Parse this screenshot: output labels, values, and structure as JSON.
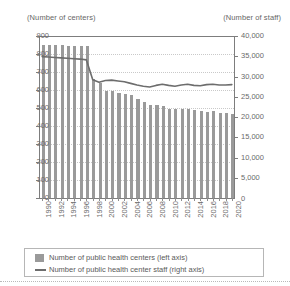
{
  "chart_data": {
    "type": "bar",
    "title": "",
    "xlabel": "",
    "left_axis_caption": "(Number of centers)",
    "right_axis_caption": "(Number of staff)",
    "grid": true,
    "legend_position": "bottom",
    "ylim": [
      0,
      900
    ],
    "y2lim": [
      0,
      40000
    ],
    "left_ticks": [
      "900",
      "800",
      "700",
      "600",
      "500",
      "400",
      "300",
      "200",
      "100",
      "0"
    ],
    "left_tick_values": [
      900,
      800,
      700,
      600,
      500,
      400,
      300,
      200,
      100,
      0
    ],
    "right_ticks": [
      "40,000",
      "35,000",
      "30,000",
      "25,000",
      "20,000",
      "15,000",
      "10,000",
      "5,000",
      "0"
    ],
    "right_tick_values": [
      40000,
      35000,
      30000,
      25000,
      20000,
      15000,
      10000,
      5000,
      0
    ],
    "x": [
      1990,
      1991,
      1992,
      1993,
      1994,
      1995,
      1996,
      1997,
      1998,
      1999,
      2000,
      2001,
      2002,
      2003,
      2004,
      2005,
      2006,
      2007,
      2008,
      2009,
      2010,
      2011,
      2012,
      2013,
      2014,
      2015,
      2016,
      2017,
      2018,
      2019,
      2020
    ],
    "x_tick_labels": [
      "1990",
      "1992",
      "1994",
      "1996",
      "1998",
      "2000",
      "2002",
      "2004",
      "2006",
      "2008",
      "2010",
      "2012",
      "2014",
      "2016",
      "2018",
      "2020"
    ],
    "x_tick_values": [
      1990,
      1992,
      1994,
      1996,
      1998,
      2000,
      2002,
      2004,
      2006,
      2008,
      2010,
      2012,
      2014,
      2016,
      2018,
      2020
    ],
    "series": [
      {
        "name": "Number of public health centers (left axis)",
        "type": "bar",
        "axis": "left",
        "color": "#9a9a9a",
        "values": [
          850,
          852,
          852,
          848,
          847,
          845,
          845,
          845,
          663,
          641,
          594,
          592,
          582,
          576,
          571,
          549,
          535,
          518,
          517,
          510,
          494,
          495,
          495,
          494,
          490,
          486,
          480,
          481,
          472,
          472,
          469
        ]
      },
      {
        "name": "Number of public health center staff (right axis)",
        "type": "line",
        "axis": "right",
        "color": "#6d6d6d",
        "values": [
          34900,
          34800,
          34700,
          34600,
          34500,
          34400,
          34300,
          34100,
          29200,
          28600,
          29000,
          29100,
          28900,
          28700,
          28300,
          27900,
          27600,
          27400,
          27800,
          28100,
          27800,
          27600,
          27900,
          28100,
          27800,
          27700,
          28000,
          28100,
          27900,
          27900,
          28000
        ]
      }
    ]
  },
  "legend": {
    "items": [
      {
        "label": "Number of public health centers (left axis)",
        "marker": "bar-swatch"
      },
      {
        "label": "Number of public health center staff (right axis)",
        "marker": "line-swatch"
      }
    ]
  },
  "right_zero_label": "0"
}
